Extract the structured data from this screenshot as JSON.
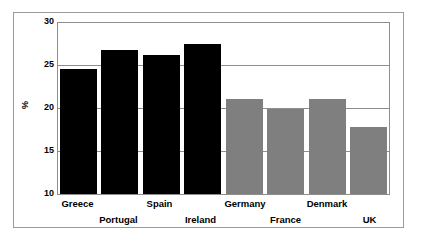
{
  "chart_data": {
    "type": "bar",
    "title": "",
    "subtitle": "",
    "xlabel": "",
    "ylabel": "%",
    "ylim": [
      10,
      30
    ],
    "yticks": [
      10,
      15,
      20,
      25,
      30
    ],
    "grid": true,
    "legend": "none",
    "categories": [
      "Greece",
      "Portugal",
      "Spain",
      "Ireland",
      "Germany",
      "France",
      "Denmark",
      "UK"
    ],
    "values": [
      24.5,
      26.7,
      26.1,
      27.4,
      21.0,
      19.8,
      21.0,
      17.7
    ],
    "bar_colors": [
      "#000000",
      "#000000",
      "#000000",
      "#000000",
      "#7f7f7f",
      "#7f7f7f",
      "#7f7f7f",
      "#7f7f7f"
    ],
    "label_rows": [
      1,
      2,
      1,
      2,
      1,
      2,
      1,
      2
    ],
    "series": [
      {
        "name": "",
        "values": [
          24.5,
          26.7,
          26.1,
          27.4,
          21.0,
          19.8,
          21.0,
          17.7
        ]
      }
    ]
  },
  "axis": {
    "y_label": "%",
    "tick_labels": [
      "30",
      "25",
      "20",
      "15",
      "10"
    ]
  }
}
